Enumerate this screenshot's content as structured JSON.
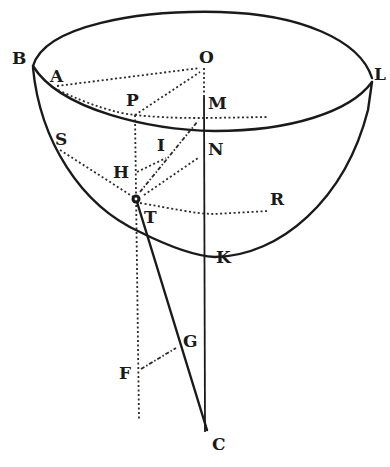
{
  "figure": {
    "labels": {
      "B": "B",
      "O": "O",
      "L": "L",
      "A": "A",
      "P": "P",
      "M": "M",
      "S": "S",
      "I": "I",
      "N": "N",
      "H": "H",
      "T": "T",
      "R": "R",
      "K": "K",
      "G": "G",
      "F": "F",
      "C": "C"
    },
    "colors": {
      "ink": "#1a1a1a",
      "background": "#ffffff"
    }
  }
}
